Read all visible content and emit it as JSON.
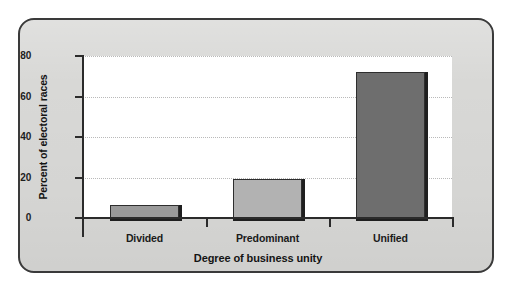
{
  "figure": {
    "frame_border_color": "#3a3a3a",
    "background_color": "#d8d8d6",
    "plot_background_color": "#ffffff"
  },
  "chart_data": {
    "type": "bar",
    "title": "",
    "subtitle": "",
    "xlabel": "Degree of business unity",
    "ylabel": "Percent of electoral races",
    "categories": [
      "Divided",
      "Predominant",
      "Unified"
    ],
    "values": [
      6.5,
      19.5,
      72
    ],
    "value_unit": "percent",
    "ylim": [
      0,
      80
    ],
    "yticks": [
      0,
      20,
      40,
      60,
      80
    ],
    "ytick_labels": [
      "0",
      "20",
      "40",
      "60",
      "80"
    ],
    "grid": true,
    "grid_axis": "y",
    "grid_style": "dotted",
    "legend": false,
    "legend_position": "none",
    "bar_colors": [
      "#9a9a9a",
      "#b2b2b2",
      "#6e6e6e"
    ],
    "bar_edge_color": "#2e2e2e",
    "bar_shadow_color": "#1f1f1f",
    "series": [
      {
        "name": "Percent of electoral races",
        "values": [
          6.5,
          19.5,
          72
        ]
      }
    ]
  }
}
